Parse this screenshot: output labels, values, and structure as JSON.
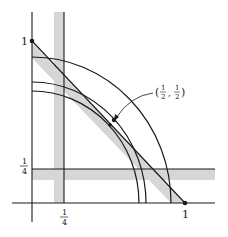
{
  "diagram": {
    "colors": {
      "line": "#1a1a1a",
      "band": "#d6d6d6",
      "background": "#ffffff"
    },
    "labels": {
      "y_one": "1",
      "x_one": "1",
      "y_quarter_num": "1",
      "y_quarter_den": "4",
      "x_quarter_num": "1",
      "x_quarter_den": "4",
      "point_open": "(",
      "point_x_num": "1",
      "point_x_den": "2",
      "point_sep": ",",
      "point_y_num": "1",
      "point_y_den": "2",
      "point_close": ")"
    },
    "point_label": "(1/2, 1/2)"
  }
}
